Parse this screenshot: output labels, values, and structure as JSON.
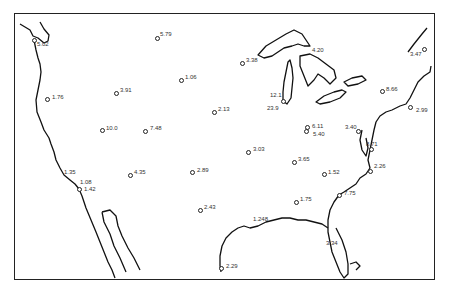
{
  "map": {
    "title": "",
    "region": "Contiguous United States",
    "border_color": "#222222",
    "stations": [
      {
        "value": "5.02",
        "cx": 34,
        "cy": 40,
        "lx": 37,
        "ly": 41
      },
      {
        "value": "5.79",
        "cx": 157,
        "cy": 38,
        "lx": 160,
        "ly": 31
      },
      {
        "value": "3.38",
        "cx": 242,
        "cy": 63,
        "lx": 246,
        "ly": 57
      },
      {
        "value": "4.20",
        "cx": null,
        "cy": null,
        "lx": 312,
        "ly": 47
      },
      {
        "value": "3.47",
        "cx": 424,
        "cy": 49,
        "lx": 410,
        "ly": 51
      },
      {
        "value": "1.76",
        "cx": 47,
        "cy": 99,
        "lx": 52,
        "ly": 94
      },
      {
        "value": "3.91",
        "cx": 116,
        "cy": 93,
        "lx": 120,
        "ly": 87
      },
      {
        "value": "1.06",
        "cx": 181,
        "cy": 80,
        "lx": 185,
        "ly": 74
      },
      {
        "value": "12.1",
        "cx": null,
        "cy": null,
        "lx": 270,
        "ly": 92
      },
      {
        "value": "23.9",
        "cx": 283,
        "cy": 101,
        "lx": 267,
        "ly": 105
      },
      {
        "value": "8.66",
        "cx": 382,
        "cy": 91,
        "lx": 386,
        "ly": 86
      },
      {
        "value": "2.99",
        "cx": 410,
        "cy": 107,
        "lx": 416,
        "ly": 107
      },
      {
        "value": "10.0",
        "cx": 102,
        "cy": 130,
        "lx": 106,
        "ly": 125
      },
      {
        "value": "7.48",
        "cx": 145,
        "cy": 131,
        "lx": 150,
        "ly": 125
      },
      {
        "value": "2.13",
        "cx": 214,
        "cy": 112,
        "lx": 218,
        "ly": 106
      },
      {
        "value": "6.11",
        "cx": 307,
        "cy": 127,
        "lx": 312,
        "ly": 123
      },
      {
        "value": "5.40",
        "cx": 306,
        "cy": 131,
        "lx": 313,
        "ly": 131
      },
      {
        "value": "8.71",
        "cx": 371,
        "cy": 149,
        "lx": 366,
        "ly": 141
      },
      {
        "value": "3.40",
        "cx": 358,
        "cy": 131,
        "lx": 345,
        "ly": 124
      },
      {
        "value": "3.03",
        "cx": 248,
        "cy": 152,
        "lx": 253,
        "ly": 146
      },
      {
        "value": "3.65",
        "cx": 294,
        "cy": 162,
        "lx": 298,
        "ly": 156
      },
      {
        "value": "1.52",
        "cx": 324,
        "cy": 174,
        "lx": 328,
        "ly": 169
      },
      {
        "value": "2.26",
        "cx": 370,
        "cy": 171,
        "lx": 374,
        "ly": 163
      },
      {
        "value": "1.35",
        "cx": null,
        "cy": null,
        "lx": 64,
        "ly": 169
      },
      {
        "value": "1.08",
        "cx": null,
        "cy": null,
        "lx": 80,
        "ly": 179
      },
      {
        "value": "1.42",
        "cx": 79,
        "cy": 189,
        "lx": 84,
        "ly": 186
      },
      {
        "value": "4.35",
        "cx": 130,
        "cy": 175,
        "lx": 134,
        "ly": 169
      },
      {
        "value": "2.89",
        "cx": 192,
        "cy": 172,
        "lx": 197,
        "ly": 167
      },
      {
        "value": "7.75",
        "cx": 339,
        "cy": 195,
        "lx": 344,
        "ly": 190
      },
      {
        "value": "1.75",
        "cx": 296,
        "cy": 202,
        "lx": 300,
        "ly": 196
      },
      {
        "value": "2.43",
        "cx": 200,
        "cy": 210,
        "lx": 204,
        "ly": 204
      },
      {
        "value": "1.248",
        "cx": null,
        "cy": null,
        "lx": 253,
        "ly": 216
      },
      {
        "value": "3.34",
        "cx": null,
        "cy": null,
        "lx": 326,
        "ly": 240
      },
      {
        "value": "2.29",
        "cx": 221,
        "cy": 268,
        "lx": 226,
        "ly": 263
      }
    ]
  }
}
